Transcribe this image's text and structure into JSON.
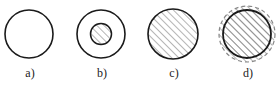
{
  "figures": [
    {
      "id": "a",
      "label": "a)",
      "description": "empty circle"
    },
    {
      "id": "b",
      "label": "b)",
      "description": "circle with hatched inner core"
    },
    {
      "id": "c",
      "label": "c)",
      "description": "fully hatched circle"
    },
    {
      "id": "d",
      "label": "d)",
      "description": "hatched circle with dashed hatched outer ring"
    }
  ],
  "colors": {
    "stroke": "#1a1a1a",
    "hatch": "#777777",
    "background": "#ffffff"
  }
}
